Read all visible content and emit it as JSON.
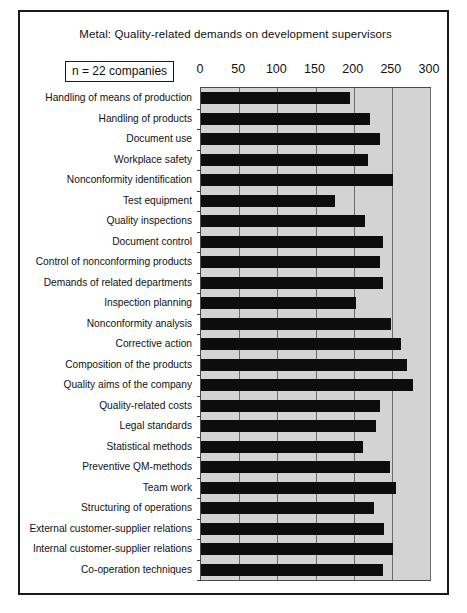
{
  "figure": {
    "title": "Metal: Quality-related demands on development supervisors",
    "annotation": "n = 22 companies",
    "frame_color": "#1a1a1a",
    "plot_background": "#d3d3d3",
    "bar_color": "#0d0d0d",
    "gridline_color": "#6b6b6b"
  },
  "chart_data": {
    "type": "bar",
    "orientation": "horizontal",
    "title": "Metal: Quality-related demands on development supervisors",
    "subtitle": "n = 22 companies",
    "xlabel": "",
    "ylabel": "",
    "xlim": [
      0,
      300
    ],
    "xticks": [
      0,
      50,
      100,
      150,
      200,
      250,
      300
    ],
    "xtick_labels": [
      "0",
      "50",
      "100",
      "150",
      "200",
      "250",
      "300"
    ],
    "grid": true,
    "grid_axis": "x",
    "legend": false,
    "categories": [
      "Handling of means of production",
      "Handling of products",
      "Document use",
      "Workplace safety",
      "Nonconformity identification",
      "Test equipment",
      "Quality inspections",
      "Document control",
      "Control of nonconforming products",
      "Demands of related departments",
      "Inspection planning",
      "Nonconformity analysis",
      "Corrective action",
      "Composition of the  products",
      "Quality aims of the company",
      "Quality-related costs",
      "Legal standards",
      "Statistical methods",
      "Preventive QM-methods",
      "Team work",
      "Structuring of operations",
      "External customer-supplier relations",
      "Internal customer-supplier relations",
      "Co-operation techniques"
    ],
    "values": [
      195,
      222,
      235,
      219,
      252,
      176,
      215,
      239,
      235,
      239,
      203,
      249,
      262,
      270,
      278,
      235,
      229,
      212,
      248,
      256,
      226,
      240,
      252,
      239
    ]
  }
}
